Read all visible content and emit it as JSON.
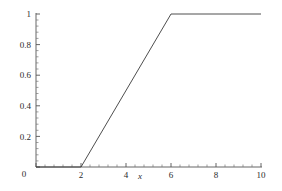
{
  "chart_data": {
    "type": "line",
    "title": "",
    "subtitle": "",
    "xlabel": "x",
    "ylabel": "",
    "xlim": [
      0,
      10
    ],
    "ylim": [
      0,
      1
    ],
    "grid": false,
    "legend": null,
    "line_color": "#3a3a3a",
    "axis_color": "#555555",
    "background": "#ffffff",
    "x_ticks": [
      {
        "value": 0,
        "label": "0"
      },
      {
        "value": 2,
        "label": "2"
      },
      {
        "value": 4,
        "label": "4"
      },
      {
        "value": 6,
        "label": "6"
      },
      {
        "value": 8,
        "label": "8"
      },
      {
        "value": 10,
        "label": "10"
      }
    ],
    "y_ticks": [
      {
        "value": 0,
        "label": "0"
      },
      {
        "value": 0.2,
        "label": "0.2"
      },
      {
        "value": 0.4,
        "label": "0.4"
      },
      {
        "value": 0.6,
        "label": "0.6"
      },
      {
        "value": 0.8,
        "label": "0.8"
      },
      {
        "value": 1,
        "label": "1"
      }
    ],
    "minor_ticks_per_interval": 4,
    "series": [
      {
        "name": "ramp",
        "x": [
          0,
          2,
          6,
          10
        ],
        "values": [
          0,
          0,
          1,
          1
        ]
      }
    ]
  },
  "labels": {
    "x0": "0",
    "x2": "2",
    "x4": "4",
    "x6": "6",
    "x8": "8",
    "x10": "10",
    "y0": "0",
    "y02": "0.2",
    "y04": "0.4",
    "y06": "0.6",
    "y08": "0.8",
    "y1": "1",
    "xaxis_title": "x"
  }
}
